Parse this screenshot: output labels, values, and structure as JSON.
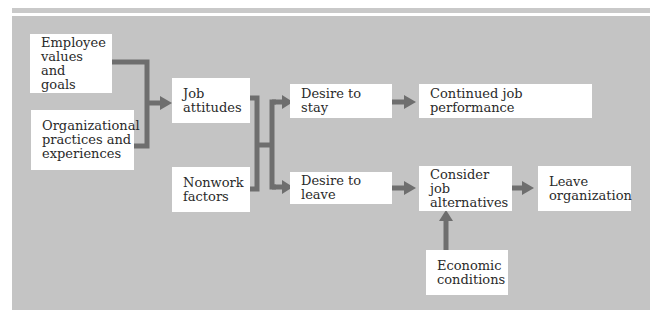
{
  "diagram": {
    "connector_color": "#6e6e6e",
    "panel_color": "#c4c4c4",
    "nodes": {
      "employee_values": "Employee\nvalues and\ngoals",
      "org_practices": "Organizational\npractices and\nexperiences",
      "job_attitudes": "Job\nattitudes",
      "nonwork_factors": "Nonwork\nfactors",
      "desire_stay": "Desire to stay",
      "desire_leave": "Desire to leave",
      "continued_performance": "Continued job performance",
      "consider_alternatives": "Consider job\nalternatives",
      "leave_org": "Leave\norganization",
      "economic_conditions": "Economic\nconditions"
    },
    "edges": [
      {
        "from": "Employee values and goals",
        "to": "Job attitudes"
      },
      {
        "from": "Organizational practices and experiences",
        "to": "Job attitudes"
      },
      {
        "from": "Job attitudes",
        "to": "Desire to stay"
      },
      {
        "from": "Job attitudes",
        "to": "Desire to leave"
      },
      {
        "from": "Nonwork factors",
        "to": "Desire to stay"
      },
      {
        "from": "Nonwork factors",
        "to": "Desire to leave"
      },
      {
        "from": "Desire to stay",
        "to": "Continued job performance"
      },
      {
        "from": "Desire to leave",
        "to": "Consider job alternatives"
      },
      {
        "from": "Consider job alternatives",
        "to": "Leave organization"
      },
      {
        "from": "Economic conditions",
        "to": "Consider job alternatives"
      }
    ]
  }
}
